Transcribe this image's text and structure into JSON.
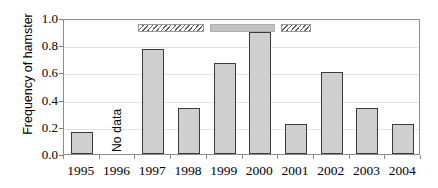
{
  "chart_data": {
    "type": "bar",
    "title": "",
    "subtitle": "",
    "xlabel": "",
    "ylabel": "Frequency of hamster",
    "ylim": [
      0.0,
      1.0
    ],
    "y_ticks": [
      "1.0",
      "0.8",
      "0.6",
      "0.4",
      "0.2",
      "0.0"
    ],
    "y_tick_values": [
      1.0,
      0.8,
      0.6,
      0.4,
      0.2,
      0.0
    ],
    "grid": true,
    "legend": "none",
    "categories": [
      "1995",
      "1996",
      "1997",
      "1998",
      "1999",
      "2000",
      "2001",
      "2002",
      "2003",
      "2004"
    ],
    "values": [
      0.16,
      null,
      0.77,
      0.34,
      0.67,
      0.9,
      0.22,
      0.6,
      0.34,
      0.22
    ],
    "missing_label": "No data",
    "missing_category": "1996",
    "annotations": [
      {
        "name": "period-bar-hatched-1",
        "style": "hatched",
        "start_category": "1997",
        "end_category": "1998"
      },
      {
        "name": "period-bar-solid",
        "style": "solid",
        "start_category": "1999",
        "end_category": "2000"
      },
      {
        "name": "period-bar-hatched-2",
        "style": "hatched",
        "start_category": "2001",
        "end_category": "2001"
      }
    ],
    "bar_fill_color": "#cfcfcf",
    "bar_edge_color": "#3b3b3b",
    "axis_color": "#8c8c8c",
    "grid_color": "#e2e2e2",
    "annotation_solid_color": "#c2c2c2",
    "annotation_hatch_color": "#5f5f5f"
  }
}
